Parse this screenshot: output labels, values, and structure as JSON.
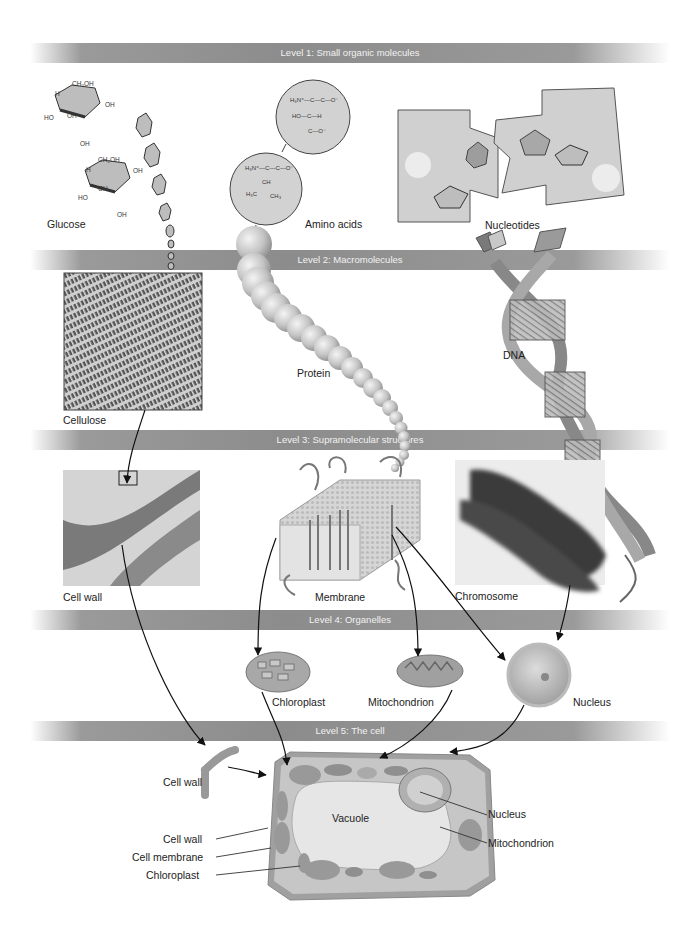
{
  "levels": [
    {
      "label": "Level 1:  Small organic molecules"
    },
    {
      "label": "Level 2:  Macromolecules"
    },
    {
      "label": "Level 3:  Supramolecular structures"
    },
    {
      "label": "Level 4:  Organelles"
    },
    {
      "label": "Level 5:  The cell"
    }
  ],
  "level1": {
    "glucose": "Glucose",
    "amino_acids": "Amino acids",
    "nucleotides": "Nucleotides",
    "glucose_groups": [
      "CH2OH",
      "OH",
      "H",
      "HO",
      "OH"
    ],
    "amino_acid_1": [
      "H3N+",
      "C",
      "C",
      "O-",
      "HO",
      "H",
      "O"
    ],
    "amino_acid_2": [
      "H3N+",
      "C",
      "O-",
      "CH",
      "H3C",
      "CH3"
    ]
  },
  "level2": {
    "cellulose": "Cellulose",
    "protein": "Protein",
    "dna": "DNA"
  },
  "level3": {
    "cell_wall": "Cell wall",
    "membrane": "Membrane",
    "chromosome": "Chromosome"
  },
  "level4": {
    "chloroplast": "Chloroplast",
    "mitochondrion": "Mitochondrion",
    "nucleus": "Nucleus"
  },
  "level5": {
    "cell_wall_piece": "Cell wall",
    "vacuole": "Vacuole",
    "callouts_left": [
      "Cell wall",
      "Cell membrane",
      "Chloroplast"
    ],
    "callouts_right": [
      "Nucleus",
      "Mitochondrion"
    ]
  },
  "colors": {
    "band": "#8c8c8c",
    "band_text": "#f2f2f2",
    "organelle": "#a8a8a8",
    "cell_wall": "#9a9a9a",
    "molecule_fill": "#cfcfcf"
  }
}
